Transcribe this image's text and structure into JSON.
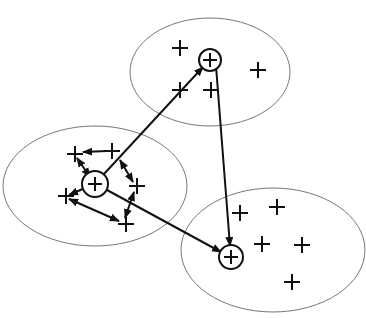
{
  "diagram": {
    "type": "clustering",
    "background": "#ffffff",
    "stroke_color": "#111111",
    "ellipse_color": "#777777",
    "clusters": [
      {
        "id": "top",
        "ellipse": {
          "cx": 210,
          "cy": 72,
          "rx": 80,
          "ry": 54
        },
        "centroid": {
          "x": 210,
          "y": 60,
          "r": 11
        },
        "points": [
          [
            180,
            48
          ],
          [
            258,
            70
          ],
          [
            180,
            90
          ],
          [
            211,
            90
          ]
        ]
      },
      {
        "id": "left",
        "ellipse": {
          "cx": 95,
          "cy": 186,
          "rx": 92,
          "ry": 60
        },
        "centroid": {
          "x": 95,
          "y": 184,
          "r": 13
        },
        "points": [
          [
            75,
            154
          ],
          [
            112,
            151
          ],
          [
            137,
            186
          ],
          [
            66,
            196
          ],
          [
            126,
            224
          ]
        ]
      },
      {
        "id": "bottom-right",
        "ellipse": {
          "cx": 273,
          "cy": 250,
          "rx": 92,
          "ry": 62
        },
        "centroid": {
          "x": 231,
          "y": 257,
          "r": 12
        },
        "points": [
          [
            240,
            213
          ],
          [
            277,
            207
          ],
          [
            262,
            244
          ],
          [
            302,
            245
          ],
          [
            292,
            282
          ]
        ]
      }
    ],
    "arrows": [
      {
        "from": [
          104,
          174
        ],
        "to": [
          203,
          67
        ],
        "head": "end"
      },
      {
        "from": [
          216,
          66
        ],
        "to": [
          230,
          246
        ],
        "head": "end"
      },
      {
        "from": [
          107,
          190
        ],
        "to": [
          221,
          252
        ],
        "head": "end"
      },
      {
        "from": [
          107,
          151
        ],
        "to": [
          83,
          152
        ],
        "head": "end"
      },
      {
        "from": [
          90,
          177
        ],
        "to": [
          77,
          158
        ],
        "head": "both"
      },
      {
        "from": [
          85,
          188
        ],
        "to": [
          69,
          195
        ],
        "head": "end"
      },
      {
        "from": [
          69,
          199
        ],
        "to": [
          119,
          221
        ],
        "head": "both"
      },
      {
        "from": [
          120,
          160
        ],
        "to": [
          133,
          182
        ],
        "head": "both"
      },
      {
        "from": [
          125,
          218
        ],
        "to": [
          134,
          192
        ],
        "head": "both"
      }
    ]
  }
}
